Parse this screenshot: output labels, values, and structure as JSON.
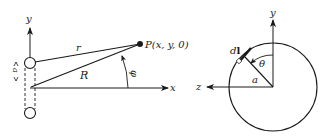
{
  "left_figure": {
    "axis_y_label": "y",
    "axis_x_label": "x",
    "point_label": "P(x, y, 0)",
    "r_label": "r",
    "R_label": "R",
    "angle_label": "φ",
    "spacing_label": "a"
  },
  "right_figure": {
    "axis_y_label": "y",
    "axis_z_label": "z",
    "dl_label_d": "d",
    "dl_label_l": "l",
    "angle_label": "θ",
    "radius_label": "a"
  },
  "colors": {
    "ink": "#1a1a1a",
    "background": "#ffffff"
  }
}
